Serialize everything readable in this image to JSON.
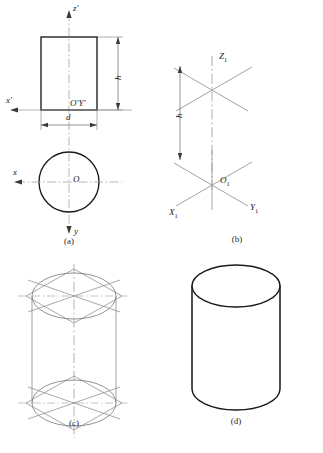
{
  "figure": {
    "panels": [
      {
        "id": "a",
        "caption": "(a)",
        "description": "Orthographic front view (rectangle) and top view (circle) with axes",
        "labels": [
          {
            "name": "axis-z-prime",
            "text": "z'"
          },
          {
            "name": "axis-x-prime",
            "text": "x'"
          },
          {
            "name": "origin-o-prime-y-prime",
            "text": "O'Y'"
          },
          {
            "name": "dimension-height",
            "text": "h"
          },
          {
            "name": "dimension-diameter",
            "text": "d"
          },
          {
            "name": "axis-x",
            "text": "x"
          },
          {
            "name": "axis-y",
            "text": "y"
          },
          {
            "name": "origin-o",
            "text": "O"
          }
        ]
      },
      {
        "id": "b",
        "caption": "(b)",
        "description": "Isometric axes at origin O1 and at height h",
        "labels": [
          {
            "name": "axis-z1",
            "text": "Z",
            "subscript": "1"
          },
          {
            "name": "axis-x1",
            "text": "X",
            "subscript": "1"
          },
          {
            "name": "axis-y1",
            "text": "Y",
            "subscript": "1"
          },
          {
            "name": "origin-o1",
            "text": "O",
            "subscript": "1"
          },
          {
            "name": "dimension-height",
            "text": "h"
          }
        ]
      },
      {
        "id": "c",
        "caption": "(c)",
        "description": "Rhombus four-centre construction of top and bottom isometric ellipses joined by vertical tangent lines",
        "labels": []
      },
      {
        "id": "d",
        "caption": "(d)",
        "description": "Completed isometric cylinder outline",
        "labels": []
      }
    ]
  },
  "style": {
    "outline_color": "#1a1a1a",
    "construction_color": "#8c8c8c",
    "centerline_color": "#9a9a9a",
    "dimension_color": "#4a4a4a",
    "background": "#ffffff"
  }
}
